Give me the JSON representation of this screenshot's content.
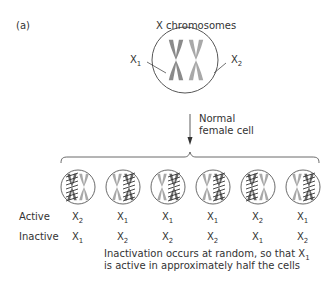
{
  "panel_label": "(a)",
  "title": "X chromosomes",
  "parent_cell": {
    "labels": [
      {
        "base": "X",
        "sub": "1"
      },
      {
        "base": "X",
        "sub": "2"
      }
    ],
    "chromosome_colors": [
      "#8a8a8a",
      "#a8a8a8"
    ]
  },
  "arrow_label_line1": "Normal",
  "arrow_label_line2": "female cell",
  "row_labels": {
    "active": "Active",
    "inactive": "Inactive"
  },
  "cells": [
    {
      "inactive_side": "left",
      "active": {
        "base": "X",
        "sub": "2"
      },
      "inactive": {
        "base": "X",
        "sub": "1"
      }
    },
    {
      "inactive_side": "right",
      "active": {
        "base": "X",
        "sub": "1"
      },
      "inactive": {
        "base": "X",
        "sub": "2"
      }
    },
    {
      "inactive_side": "right",
      "active": {
        "base": "X",
        "sub": "1"
      },
      "inactive": {
        "base": "X",
        "sub": "2"
      }
    },
    {
      "inactive_side": "right",
      "active": {
        "base": "X",
        "sub": "1"
      },
      "inactive": {
        "base": "X",
        "sub": "2"
      }
    },
    {
      "inactive_side": "left",
      "active": {
        "base": "X",
        "sub": "2"
      },
      "inactive": {
        "base": "X",
        "sub": "1"
      }
    },
    {
      "inactive_side": "right",
      "active": {
        "base": "X",
        "sub": "1"
      },
      "inactive": {
        "base": "X",
        "sub": "2"
      }
    }
  ],
  "caption_line1_pre": "Inactivation occurs at random, so that X",
  "caption_line1_sub": "1",
  "caption_line2": "is active in approximately half the cells"
}
